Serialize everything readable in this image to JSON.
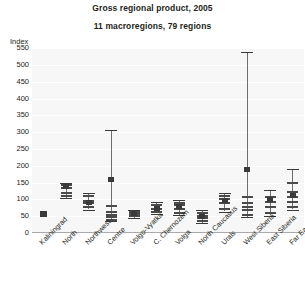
{
  "chart": {
    "title": "Gross regional product, 2005",
    "subtitle": "11 macroregions, 79 regions",
    "axis_unit_label": "Index"
  },
  "chart_data": {
    "type": "boxplot",
    "title": "Gross regional product, 2005",
    "subtitle": "11 macroregions, 79 regions",
    "xlabel": "",
    "ylabel": "Index",
    "ylim": [
      0,
      550
    ],
    "ytick_labels": [
      "0",
      "50",
      "100",
      "150",
      "200",
      "250",
      "300",
      "350",
      "400",
      "450",
      "500",
      "550"
    ],
    "ytick_values": [
      0,
      50,
      100,
      150,
      200,
      250,
      300,
      350,
      400,
      450,
      500,
      550
    ],
    "grid": true,
    "legend": "none",
    "categories": [
      "Kaliningrad",
      "North",
      "Northwest",
      "Centre",
      "Volgo-Vyatka",
      "C. Chernozem",
      "Volga",
      "North Caucasus",
      "Urals",
      "West Siberia",
      "East Siberia",
      "Far East"
    ],
    "series": [
      {
        "name": "Kaliningrad",
        "min": 57,
        "max": 57,
        "mean": 57,
        "ticks": [
          57
        ],
        "single_point": true
      },
      {
        "name": "North",
        "min": 105,
        "max": 150,
        "mean": 138,
        "ticks": [
          110,
          120,
          133,
          143
        ]
      },
      {
        "name": "Northwest",
        "min": 70,
        "max": 120,
        "mean": 92,
        "ticks": [
          78,
          88,
          96,
          110
        ]
      },
      {
        "name": "Centre",
        "min": 35,
        "max": 305,
        "mean": 160,
        "ticks": [
          40,
          48,
          55,
          62,
          80
        ]
      },
      {
        "name": "Volgo-Vyatka",
        "min": 44,
        "max": 70,
        "mean": 58,
        "ticks": [
          50,
          58,
          64
        ]
      },
      {
        "name": "C. Chernozem",
        "min": 58,
        "max": 92,
        "mean": 73,
        "ticks": [
          63,
          72,
          82
        ]
      },
      {
        "name": "Volga",
        "min": 54,
        "max": 98,
        "mean": 78,
        "ticks": [
          60,
          72,
          82,
          90
        ]
      },
      {
        "name": "North Caucasus",
        "min": 30,
        "max": 68,
        "mean": 48,
        "ticks": [
          36,
          44,
          52,
          60
        ]
      },
      {
        "name": "Urals",
        "min": 64,
        "max": 118,
        "mean": 98,
        "ticks": [
          72,
          88,
          100,
          110
        ]
      },
      {
        "name": "West Siberia",
        "min": 48,
        "max": 538,
        "mean": 188,
        "ticks": [
          54,
          68,
          78,
          90,
          108
        ]
      },
      {
        "name": "East Siberia",
        "min": 52,
        "max": 128,
        "mean": 100,
        "ticks": [
          60,
          78,
          92,
          108
        ]
      },
      {
        "name": "Far East",
        "min": 70,
        "max": 190,
        "mean": 112,
        "ticks": [
          78,
          92,
          106,
          122,
          150
        ]
      }
    ]
  },
  "colors": {
    "plot_background": "#f7f7f7",
    "gridline": "#ffffff",
    "marker": "#3a3a3a",
    "whisker": "#6e6e6e",
    "text": "#231f20"
  }
}
